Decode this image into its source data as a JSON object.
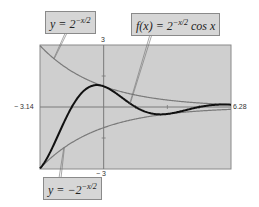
{
  "chart_data": {
    "type": "line",
    "title": "",
    "xlabel": "",
    "ylabel": "",
    "xlim": [
      -3.14,
      6.28
    ],
    "ylim": [
      -3,
      3
    ],
    "grid": false,
    "tick_labels": {
      "x_min": "− 3.14",
      "x_max": "6.28",
      "y_max": "3",
      "y_min": "− 3"
    },
    "series": [
      {
        "name": "y = 2^(-x/2)",
        "expr": "2^(-x/2)",
        "color": "#7a7a7a",
        "width": 1.2
      },
      {
        "name": "y = -2^(-x/2)",
        "expr": "-2^(-x/2)",
        "color": "#7a7a7a",
        "width": 1.2
      },
      {
        "name": "f(x) = 2^(-x/2) cos x",
        "expr": "2^(-x/2)*cos(x)",
        "color": "#111111",
        "width": 2
      }
    ],
    "annotations": [
      {
        "id": "upper",
        "text_parts": [
          "y = 2",
          "−x/2"
        ],
        "points_to_x": -2.45
      },
      {
        "id": "f",
        "text_parts": [
          "f(x) = 2",
          "−x/2",
          " cos x"
        ],
        "points_to_x": 1.3
      },
      {
        "id": "lower",
        "text_parts": [
          "y = −2",
          "−x/2"
        ],
        "points_to_x": -1.95
      }
    ]
  },
  "colors": {
    "plot_background": "#cfcfcf",
    "frame": "#8a8a8a",
    "axis": "#7a7a7a",
    "label_background": "#d6d6d6"
  }
}
